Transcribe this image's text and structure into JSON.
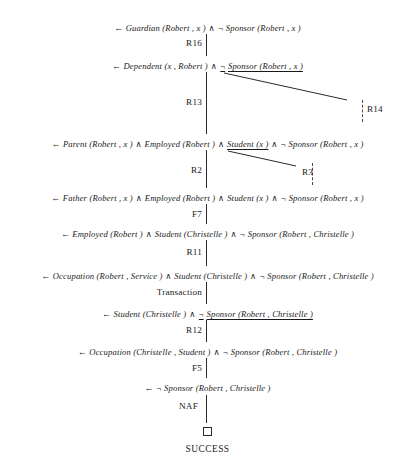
{
  "diagram": {
    "success_label": "SUCCESS",
    "empty_clause_symbol": "□",
    "arrow": "←",
    "and": "∧",
    "not": "¬",
    "nodes": [
      {
        "id": "n1",
        "text": "← Guardian (Robert , x ) ∧ ¬ Sponsor (Robert , x )",
        "parts": [
          {
            "t": "←",
            "k": "arrow"
          },
          {
            "t": "Guardian (Robert , x )",
            "k": "atom"
          },
          {
            "t": "∧",
            "k": "op"
          },
          {
            "t": "¬",
            "k": "op"
          },
          {
            "t": "Sponsor (Robert , x )",
            "k": "atom"
          }
        ]
      },
      {
        "id": "n2",
        "text": "← Dependent (x , Robert ) ∧ ¬ Sponsor (Robert , x )",
        "parts": [
          {
            "t": "←",
            "k": "arrow"
          },
          {
            "t": "Dependent (x , Robert )",
            "k": "atom"
          },
          {
            "t": "∧",
            "k": "op"
          },
          {
            "t": "¬",
            "k": "op"
          },
          {
            "t": "Sponsor (Robert , x )",
            "k": "sel"
          }
        ]
      },
      {
        "id": "n3",
        "text": "← Parent (Robert , x ) ∧ Employed (Robert ) ∧ Student (x ) ∧ ¬ Sponsor (Robert , x )",
        "parts": [
          {
            "t": "←",
            "k": "arrow"
          },
          {
            "t": "Parent (Robert , x )",
            "k": "atom"
          },
          {
            "t": "∧",
            "k": "op"
          },
          {
            "t": "Employed (Robert )",
            "k": "atom"
          },
          {
            "t": "∧",
            "k": "op"
          },
          {
            "t": "Student (x )",
            "k": "sel"
          },
          {
            "t": "∧",
            "k": "op"
          },
          {
            "t": "¬",
            "k": "op"
          },
          {
            "t": "Sponsor (Robert , x )",
            "k": "atom"
          }
        ]
      },
      {
        "id": "n4",
        "text": "← Father (Robert , x ) ∧ Employed (Robert ) ∧ Student (x ) ∧ ¬ Sponsor (Robert , x )",
        "parts": [
          {
            "t": "←",
            "k": "arrow"
          },
          {
            "t": "Father (Robert , x )",
            "k": "atom"
          },
          {
            "t": "∧",
            "k": "op"
          },
          {
            "t": "Employed (Robert )",
            "k": "atom"
          },
          {
            "t": "∧",
            "k": "op"
          },
          {
            "t": "Student (x )",
            "k": "atom"
          },
          {
            "t": "∧",
            "k": "op"
          },
          {
            "t": "¬",
            "k": "op"
          },
          {
            "t": "Sponsor (Robert , x )",
            "k": "atom"
          }
        ]
      },
      {
        "id": "n5",
        "text": "← Employed (Robert ) ∧ Student (Christelle ) ∧ ¬ Sponsor (Robert , Christelle )",
        "parts": [
          {
            "t": "←",
            "k": "arrow"
          },
          {
            "t": "Employed (Robert )",
            "k": "atom"
          },
          {
            "t": "∧",
            "k": "op"
          },
          {
            "t": "Student (Christelle )",
            "k": "atom"
          },
          {
            "t": "∧",
            "k": "op"
          },
          {
            "t": "¬",
            "k": "op"
          },
          {
            "t": "Sponsor (Robert , Christelle )",
            "k": "atom"
          }
        ]
      },
      {
        "id": "n6",
        "text": "← Occupation (Robert , Service ) ∧ Student (Christelle ) ∧ ¬ Sponsor (Robert , Christelle )",
        "parts": [
          {
            "t": "←",
            "k": "arrow"
          },
          {
            "t": "Occupation (Robert , Service )",
            "k": "atom"
          },
          {
            "t": "∧",
            "k": "op"
          },
          {
            "t": "Student (Christelle )",
            "k": "atom"
          },
          {
            "t": "∧",
            "k": "op"
          },
          {
            "t": "¬",
            "k": "op"
          },
          {
            "t": "Sponsor (Robert , Christelle )",
            "k": "atom"
          }
        ]
      },
      {
        "id": "n7",
        "text": "← Student (Christelle ) ∧ ¬ Sponsor (Robert , Christelle )",
        "parts": [
          {
            "t": "←",
            "k": "arrow"
          },
          {
            "t": "Student (Christelle )",
            "k": "atom"
          },
          {
            "t": "∧",
            "k": "op"
          },
          {
            "t": "¬",
            "k": "op"
          },
          {
            "t": "Sponsor (Robert , Christelle )",
            "k": "sel"
          }
        ]
      },
      {
        "id": "n8",
        "text": "← Occupation (Christelle , Student ) ∧ ¬ Sponsor (Robert , Christelle )",
        "parts": [
          {
            "t": "←",
            "k": "arrow"
          },
          {
            "t": "Occupation (Christelle , Student )",
            "k": "atom"
          },
          {
            "t": "∧",
            "k": "op"
          },
          {
            "t": "¬",
            "k": "op"
          },
          {
            "t": "Sponsor (Robert , Christelle )",
            "k": "atom"
          }
        ]
      },
      {
        "id": "n9",
        "text": "← ¬ Sponsor (Robert , Christelle )",
        "parts": [
          {
            "t": "←",
            "k": "arrow"
          },
          {
            "t": "¬",
            "k": "op"
          },
          {
            "t": "Sponsor (Robert , Christelle )",
            "k": "atom"
          }
        ]
      }
    ],
    "edge_labels": {
      "e1": "R16",
      "e2": "R13",
      "e2b": "R14",
      "e3": "R2",
      "e3b": "R3",
      "e4": "F7",
      "e5": "R11",
      "e6": "Transaction",
      "e7": "R12",
      "e8": "F5",
      "e9": "NAF"
    }
  }
}
